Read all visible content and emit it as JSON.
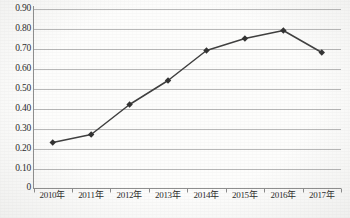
{
  "chart_data": {
    "type": "line",
    "title": "",
    "subtitle": "",
    "xlabel": "",
    "ylabel": "",
    "categories": [
      "2010年",
      "2011年",
      "2012年",
      "2013年",
      "2014年",
      "2015年",
      "2016年",
      "2017年"
    ],
    "values": [
      0.23,
      0.27,
      0.42,
      0.54,
      0.69,
      0.75,
      0.79,
      0.68
    ],
    "series": [
      {
        "name": "",
        "values": [
          0.23,
          0.27,
          0.42,
          0.54,
          0.69,
          0.75,
          0.79,
          0.68
        ]
      }
    ],
    "ylim": [
      0,
      0.9
    ],
    "xlim_categories": 8,
    "y_ticks": [
      0.9,
      0.8,
      0.7,
      0.6,
      0.5,
      0.4,
      0.3,
      0.2,
      0.1,
      0
    ],
    "y_tick_labels": [
      "0.90",
      "0.80",
      "0.70",
      "0.60",
      "0.50",
      "0.40",
      "0.30",
      "0.20",
      "0.10",
      "0"
    ],
    "x_tick_labels": [
      "2010年",
      "2011年",
      "2012年",
      "2013年",
      "2014年",
      "2015年",
      "2016年",
      "2017年"
    ],
    "grid": {
      "horizontal": true,
      "vertical": false
    },
    "legend": {
      "visible": false,
      "position": "none",
      "entries": []
    },
    "annotations": [],
    "marker": "diamond",
    "colors": {
      "line": "#404040",
      "marker": "#333333",
      "grid": "#b8b8b8",
      "axis": "#8c8c8c",
      "text": "#2b2b2b",
      "background": "#fdfdfc"
    }
  }
}
